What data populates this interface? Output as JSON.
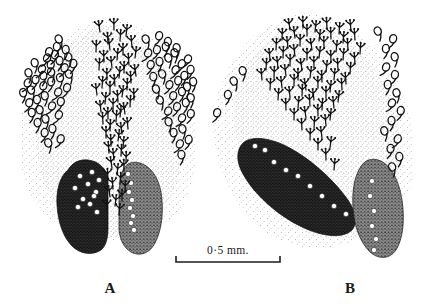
{
  "figure": {
    "kind": "scientific-line-drawing",
    "background_color": "#ffffff",
    "ink_color": "#111111",
    "panels": [
      {
        "id": "A",
        "label": "A",
        "label_x": 110,
        "label_y": 293,
        "description": "symmetrical paired dark lobes with central trident sensilla column"
      },
      {
        "id": "B",
        "label": "B",
        "label_x": 350,
        "label_y": 293,
        "description": "oblique dark lobe at left and upright dark lobe at right with trident sensilla field"
      }
    ],
    "scale_bar": {
      "label": "0·5 mm.",
      "x1": 176,
      "x2": 280,
      "y": 262,
      "tick_height": 6,
      "text_x": 228,
      "text_y": 254
    },
    "icons": {
      "trident": "trident-sensillum-icon",
      "loop": "loop-sensillum-icon",
      "pore": "pore-spot-icon",
      "stipple": "stipple-shading-icon"
    }
  },
  "chart_data": {
    "type": "scatter",
    "title": "",
    "xlabel": "",
    "ylabel": "",
    "xlim": [
      0,
      425
    ],
    "ylim": [
      0,
      307
    ],
    "grid": false,
    "legend": null,
    "annotations": [
      "A",
      "B",
      "0·5 mm."
    ],
    "series": [
      {
        "name": "A-trident-sensilla",
        "marker": "trident",
        "x": [
          100,
          114,
          126,
          108,
          120,
          132,
          96,
          110,
          123,
          135,
          104,
          117,
          129,
          99,
          112,
          124,
          136,
          107,
          119,
          131,
          102,
          115,
          127,
          97,
          110,
          122,
          134,
          105,
          118,
          130,
          101,
          113,
          125,
          108,
          120,
          103,
          116,
          128,
          110,
          122,
          106,
          118,
          111,
          123,
          109,
          121,
          114,
          126,
          112,
          124,
          117,
          108,
          120,
          113,
          125,
          110,
          122,
          115,
          107,
          119
        ],
        "y": [
          32,
          30,
          36,
          44,
          41,
          47,
          52,
          50,
          55,
          58,
          62,
          60,
          65,
          70,
          68,
          73,
          76,
          80,
          78,
          83,
          88,
          86,
          90,
          95,
          93,
          97,
          100,
          104,
          102,
          107,
          112,
          110,
          114,
          119,
          117,
          124,
          122,
          129,
          131,
          134,
          138,
          141,
          146,
          148,
          153,
          156,
          160,
          163,
          168,
          171,
          175,
          180,
          184,
          189,
          192,
          197,
          201,
          206,
          211,
          215
        ],
        "size": 9
      },
      {
        "name": "A-loop-sensilla-left",
        "marker": "loop",
        "x": [
          61,
          48,
          57,
          36,
          45,
          54,
          66,
          30,
          40,
          50,
          60,
          70,
          26,
          35,
          44,
          53,
          63,
          73,
          24,
          33,
          42,
          51,
          61,
          71,
          28,
          37,
          46,
          56,
          66,
          32,
          41,
          50,
          60,
          38,
          47,
          57,
          44,
          53,
          50,
          59
        ],
        "y": [
          44,
          57,
          52,
          68,
          63,
          60,
          55,
          78,
          74,
          70,
          66,
          62,
          88,
          85,
          81,
          77,
          73,
          69,
          98,
          95,
          91,
          87,
          83,
          79,
          108,
          105,
          101,
          97,
          93,
          118,
          115,
          111,
          107,
          128,
          124,
          120,
          138,
          134,
          148,
          144
        ],
        "size": 9
      },
      {
        "name": "A-loop-sensilla-right",
        "marker": "loop",
        "x": [
          148,
          158,
          168,
          178,
          146,
          156,
          166,
          176,
          186,
          150,
          160,
          170,
          180,
          190,
          154,
          164,
          174,
          184,
          194,
          158,
          168,
          178,
          188,
          162,
          172,
          182,
          192,
          166,
          176,
          186,
          170,
          180,
          190,
          174,
          184,
          178,
          188,
          182
        ],
        "y": [
          44,
          41,
          47,
          53,
          58,
          55,
          52,
          58,
          64,
          70,
          67,
          63,
          69,
          75,
          82,
          79,
          75,
          81,
          87,
          94,
          90,
          86,
          92,
          105,
          101,
          97,
          103,
          116,
          112,
          108,
          127,
          123,
          119,
          138,
          134,
          149,
          145,
          160
        ],
        "size": 9
      },
      {
        "name": "A-lobe-left-pores",
        "marker": "pore",
        "x": [
          80,
          92,
          99,
          75,
          88,
          96,
          83,
          94,
          78,
          90,
          97
        ],
        "y": [
          176,
          172,
          180,
          188,
          184,
          192,
          199,
          196,
          207,
          204,
          212
        ],
        "size": 4
      },
      {
        "name": "A-lobe-right-pores",
        "marker": "pore",
        "x": [
          128,
          131,
          129,
          132,
          130,
          133,
          131,
          134
        ],
        "y": [
          174,
          183,
          192,
          200,
          208,
          216,
          223,
          230
        ],
        "size": 4
      },
      {
        "name": "B-trident-sensilla",
        "marker": "trident",
        "x": [
          290,
          303,
          315,
          327,
          339,
          351,
          282,
          295,
          307,
          319,
          331,
          343,
          355,
          276,
          288,
          300,
          312,
          324,
          336,
          348,
          360,
          270,
          283,
          295,
          307,
          319,
          331,
          343,
          355,
          266,
          278,
          290,
          302,
          314,
          326,
          338,
          350,
          262,
          274,
          286,
          298,
          310,
          322,
          334,
          346,
          270,
          282,
          294,
          306,
          318,
          330,
          342,
          278,
          290,
          302,
          314,
          326,
          338,
          286,
          298,
          310,
          322,
          334,
          294,
          306,
          318,
          330,
          302,
          314,
          326,
          310,
          322,
          318,
          330,
          326,
          334
        ],
        "y": [
          30,
          28,
          32,
          29,
          34,
          31,
          40,
          38,
          36,
          41,
          39,
          43,
          40,
          50,
          48,
          46,
          50,
          48,
          52,
          50,
          54,
          60,
          58,
          56,
          60,
          58,
          62,
          60,
          64,
          70,
          68,
          66,
          70,
          68,
          72,
          70,
          74,
          80,
          78,
          76,
          80,
          78,
          82,
          80,
          84,
          90,
          88,
          86,
          90,
          88,
          92,
          90,
          100,
          98,
          96,
          100,
          98,
          102,
          110,
          108,
          106,
          110,
          108,
          120,
          118,
          116,
          120,
          130,
          128,
          126,
          140,
          138,
          150,
          148,
          160,
          170
        ],
        "size": 9
      },
      {
        "name": "B-loop-sensilla-left",
        "marker": "loop",
        "x": [
          236,
          216,
          228,
          244
        ],
        "y": [
          86,
          118,
          100,
          76
        ],
        "size": 9
      },
      {
        "name": "B-loop-sensilla-right",
        "marker": "loop",
        "x": [
          380,
          392,
          386,
          396,
          384,
          394,
          388,
          398,
          390,
          400,
          392,
          386,
          396,
          390,
          400,
          394
        ],
        "y": [
          36,
          44,
          54,
          62,
          72,
          80,
          90,
          98,
          108,
          116,
          126,
          136,
          144,
          154,
          162,
          172
        ],
        "size": 9
      },
      {
        "name": "B-lobe-oblique-pores",
        "marker": "pore",
        "x": [
          255,
          265,
          274,
          286,
          298,
          310,
          322,
          334,
          346
        ],
        "y": [
          146,
          150,
          162,
          170,
          176,
          186,
          196,
          206,
          214
        ],
        "size": 4
      },
      {
        "name": "B-lobe-right-pores",
        "marker": "pore",
        "x": [
          372,
          370,
          374,
          372,
          376,
          374
        ],
        "y": [
          181,
          196,
          211,
          226,
          239,
          250
        ],
        "size": 4
      }
    ]
  }
}
